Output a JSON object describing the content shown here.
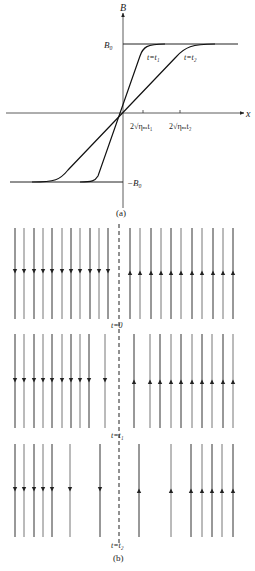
{
  "chart_data": {
    "type": "line",
    "panel_a": {
      "caption": "(a)",
      "xlabel": "x",
      "ylabel": "B",
      "y_ticks": [
        {
          "label": "B₀",
          "value": 1
        },
        {
          "label": "−B₀",
          "value": -1
        }
      ],
      "x_ticks": [
        {
          "label": "2√ηₘt₁",
          "value": 1
        },
        {
          "label": "2√ηₘt₂",
          "value": 2
        }
      ],
      "series": [
        {
          "name": "t = t₁",
          "label": "t=t₁",
          "description": "steep erf profile, saturates at ±B₀ beyond ~±2√ηₘt₁"
        },
        {
          "name": "t = t₂",
          "label": "t=t₂",
          "description": "broader erf profile, saturates at ±B₀ beyond ~±2√ηₘt₂"
        }
      ],
      "grid": false,
      "legend": "inline curve labels"
    },
    "panel_b": {
      "caption": "(b)",
      "description": "Magnetic field lines on either side of a current sheet (dashed line); left lines point down, right lines point up; lines near the sheet diffuse/annihilate with time.",
      "rows": [
        {
          "label": "t=0",
          "left_count": 11,
          "right_count": 11,
          "left_direction": "down",
          "right_direction": "up"
        },
        {
          "label": "t=t₁",
          "left_count": 10,
          "right_count": 10,
          "left_direction": "down",
          "right_direction": "up"
        },
        {
          "label": "t=t₂",
          "left_count": 7,
          "right_count": 7,
          "left_direction": "down",
          "right_direction": "up"
        }
      ]
    }
  },
  "labels": {
    "panel_a_caption": "(a)",
    "panel_b_caption": "(b)",
    "axis_x": "x",
    "axis_y": "B",
    "b0": "B₀",
    "neg_b0": "−B₀",
    "tick1": "2√ηₘt₁",
    "tick2": "2√ηₘt₂",
    "curve1": "t=t₁",
    "curve2": "t=t₂",
    "row0": "t=0",
    "row1": "t=t₁",
    "row2": "t=t₂"
  },
  "rows_geometry": [
    {
      "y1": 228,
      "y2": 319,
      "arrow_y": 272,
      "left_x": [
        15,
        24,
        34,
        43,
        52,
        62,
        71,
        80,
        90,
        99,
        108
      ],
      "right_x": [
        130,
        140,
        151,
        161,
        171,
        181,
        192,
        202,
        213,
        223,
        233
      ]
    },
    {
      "y1": 334,
      "y2": 428,
      "arrow_y": 381,
      "left_x": [
        15,
        24,
        34,
        43,
        52,
        62,
        71,
        80,
        89,
        105
      ],
      "right_x": [
        134,
        150,
        160,
        171,
        181,
        192,
        202,
        212,
        223,
        233
      ]
    },
    {
      "y1": 444,
      "y2": 537,
      "arrow_y": 490,
      "left_x": [
        15,
        24,
        34,
        43,
        52,
        70,
        100
      ],
      "right_x": [
        139,
        171,
        191,
        202,
        212,
        222,
        233
      ]
    }
  ]
}
